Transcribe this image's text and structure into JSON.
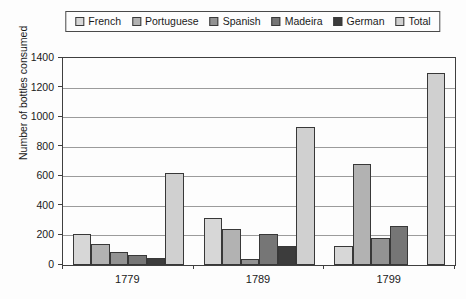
{
  "chart_data": {
    "type": "bar",
    "categories": [
      "1779",
      "1789",
      "1799"
    ],
    "series": [
      {
        "name": "French",
        "color": "#d7d7d7",
        "values": [
          210,
          315,
          130
        ]
      },
      {
        "name": "Portuguese",
        "color": "#b2b2b2",
        "values": [
          140,
          245,
          680
        ]
      },
      {
        "name": "Spanish",
        "color": "#939393",
        "values": [
          90,
          40,
          185
        ]
      },
      {
        "name": "Madeira",
        "color": "#767676",
        "values": [
          70,
          210,
          265
        ]
      },
      {
        "name": "German",
        "color": "#3c3c3c",
        "values": [
          50,
          130,
          0
        ]
      },
      {
        "name": "Total",
        "color": "#d0d0d0",
        "values": [
          620,
          935,
          1300
        ]
      }
    ],
    "title": "",
    "xlabel": "",
    "ylabel": "Number of bottles consumed",
    "ylim": [
      0,
      1400
    ],
    "ytick_step": 200,
    "yticks": [
      "0",
      "200",
      "400",
      "600",
      "800",
      "1000",
      "1200",
      "1400"
    ],
    "grid": true,
    "legend_position": "top"
  }
}
